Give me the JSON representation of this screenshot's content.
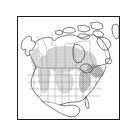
{
  "figure": {
    "kind": "range-map",
    "title": "North America distribution map",
    "frame": {
      "border_color": "#1a1a1a",
      "background_color": "#ffffff",
      "border_width_px": 1,
      "x": 17,
      "y": 16,
      "width": 103,
      "height": 104
    },
    "map": {
      "region": "North America",
      "projection_note": "conic",
      "coastline_color": "#3a3a3a",
      "boundary_color": "#7a7a7a",
      "land_fill": "#ffffff",
      "range_fill": "#c9c9c9",
      "range_fill_dense": "#9e9e9e",
      "countries": [
        "Canada",
        "United States",
        "Mexico",
        "Greenland"
      ],
      "features": [
        {
          "name": "canada-outline",
          "type": "country-outline"
        },
        {
          "name": "united-states-outline",
          "type": "country-outline"
        },
        {
          "name": "mexico-outline",
          "type": "country-outline"
        },
        {
          "name": "alaska-outline",
          "type": "country-outline"
        },
        {
          "name": "arctic-islands",
          "type": "island-group"
        },
        {
          "name": "great-lakes",
          "type": "water-body"
        },
        {
          "name": "hudson-bay",
          "type": "water-body"
        }
      ],
      "range_shading": [
        {
          "name": "northern-great-plains-range",
          "density": "light"
        },
        {
          "name": "great-lakes-range",
          "density": "light"
        },
        {
          "name": "northeast-range",
          "density": "dense"
        },
        {
          "name": "western-interior-range",
          "density": "light"
        },
        {
          "name": "rocky-mountain-range",
          "density": "light"
        },
        {
          "name": "pacific-northwest-range",
          "density": "light"
        },
        {
          "name": "appalachian-range",
          "density": "dense"
        }
      ]
    }
  }
}
